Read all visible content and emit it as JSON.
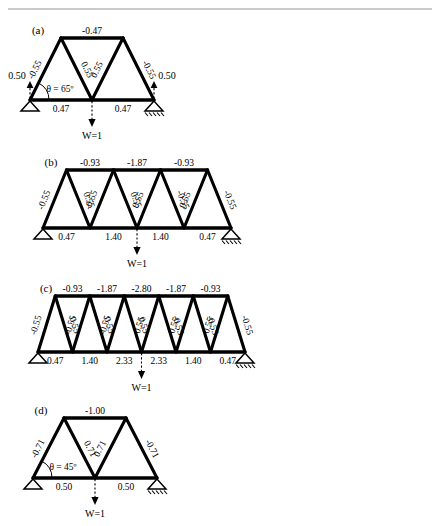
{
  "figure": {
    "background": "#ffffff",
    "ink_color": "#000000",
    "top_rule_color": "#b9b9b9",
    "load_text": "W=1",
    "panels": [
      {
        "id": "a",
        "label": "(a)",
        "angle_label": "θ = 65º",
        "bays": 2,
        "left_reaction": "0.50",
        "right_reaction": "0.50",
        "top_chord": [
          "-0.47"
        ],
        "bottom_chord": [
          "0.47",
          "0.47"
        ],
        "diagonals": [
          "-0.55",
          "0.55",
          "0.55",
          "-0.55"
        ],
        "load_text": "W=1"
      },
      {
        "id": "b",
        "label": "(b)",
        "angle_label": "",
        "bays": 4,
        "left_reaction": "",
        "right_reaction": "",
        "top_chord": [
          "-0.93",
          "-1.87",
          "-0.93"
        ],
        "bottom_chord": [
          "0.47",
          "1.40",
          "1.40",
          "0.47"
        ],
        "diagonals": [
          "-0.55",
          "0.55",
          "-0.55",
          "0.55",
          "0.55",
          "-0.55",
          "0.55",
          "-0.55"
        ],
        "load_text": "W=1"
      },
      {
        "id": "c",
        "label": "(c)",
        "angle_label": "",
        "bays": 6,
        "left_reaction": "",
        "right_reaction": "",
        "top_chord": [
          "-0.93",
          "-1.87",
          "-2.80",
          "-1.87",
          "-0.93"
        ],
        "bottom_chord": [
          "0.47",
          "1.40",
          "2.33",
          "2.33",
          "1.40",
          "0.47"
        ],
        "diagonals": [
          "-0.55",
          "0.55",
          "-0.55",
          "0.55",
          "-0.55",
          "0.55",
          "0.55",
          "-0.55",
          "0.55",
          "-0.55",
          "0.55",
          "-0.55"
        ],
        "load_text": "W=1"
      },
      {
        "id": "d",
        "label": "(d)",
        "angle_label": "θ = 45º",
        "bays": 2,
        "left_reaction": "",
        "right_reaction": "",
        "top_chord": [
          "-1.00"
        ],
        "bottom_chord": [
          "0.50",
          "0.50"
        ],
        "diagonals": [
          "-0.71",
          "0.71",
          "0.71",
          "-0.71"
        ],
        "load_text": "W=1"
      }
    ]
  },
  "chart_data": {
    "type": "diagram",
    "subtitle": "Four truss configurations with increasing number of bays",
    "panels": [
      {
        "panel": "a",
        "panel_label": "(a)",
        "n_bays": 2,
        "span_nodes_bottom": 3,
        "span_nodes_top": 2,
        "inclination_deg": 65,
        "angle_annotation": "θ = 65º",
        "unit_load": "W=1",
        "load_position": "mid-span bottom node",
        "reactions": {
          "left": 0.5,
          "right": 0.5
        },
        "supports": {
          "left": "pin",
          "right": "roller"
        },
        "top_chord_forces": [
          -0.47
        ],
        "bottom_chord_forces": [
          0.47,
          0.47
        ],
        "diagonal_forces": [
          -0.55,
          0.55,
          0.55,
          -0.55
        ],
        "sign_convention": "negative = compression, positive = tension"
      },
      {
        "panel": "b",
        "panel_label": "(b)",
        "n_bays": 4,
        "span_nodes_bottom": 5,
        "span_nodes_top": 4,
        "inclination_deg": 65,
        "angle_annotation": "",
        "unit_load": "W=1",
        "load_position": "mid-span bottom node",
        "reactions": {
          "left": 0.5,
          "right": 0.5
        },
        "supports": {
          "left": "pin",
          "right": "roller"
        },
        "top_chord_forces": [
          -0.93,
          -1.87,
          -0.93
        ],
        "bottom_chord_forces": [
          0.47,
          1.4,
          1.4,
          0.47
        ],
        "diagonal_forces": [
          -0.55,
          0.55,
          -0.55,
          0.55,
          0.55,
          -0.55,
          0.55,
          -0.55
        ],
        "sign_convention": "negative = compression, positive = tension"
      },
      {
        "panel": "c",
        "panel_label": "(c)",
        "n_bays": 6,
        "span_nodes_bottom": 7,
        "span_nodes_top": 6,
        "inclination_deg": 65,
        "angle_annotation": "",
        "unit_load": "W=1",
        "load_position": "mid-span bottom node",
        "reactions": {
          "left": 0.5,
          "right": 0.5
        },
        "supports": {
          "left": "pin",
          "right": "roller"
        },
        "top_chord_forces": [
          -0.93,
          -1.87,
          -2.8,
          -1.87,
          -0.93
        ],
        "bottom_chord_forces": [
          0.47,
          1.4,
          2.33,
          2.33,
          1.4,
          0.47
        ],
        "diagonal_forces": [
          -0.55,
          0.55,
          -0.55,
          0.55,
          -0.55,
          0.55,
          0.55,
          -0.55,
          0.55,
          -0.55,
          0.55,
          -0.55
        ],
        "sign_convention": "negative = compression, positive = tension"
      },
      {
        "panel": "d",
        "panel_label": "(d)",
        "n_bays": 2,
        "span_nodes_bottom": 3,
        "span_nodes_top": 2,
        "inclination_deg": 45,
        "angle_annotation": "θ = 45º",
        "unit_load": "W=1",
        "load_position": "mid-span bottom node",
        "reactions": {
          "left": 0.5,
          "right": 0.5
        },
        "supports": {
          "left": "pin",
          "right": "roller"
        },
        "top_chord_forces": [
          -1.0
        ],
        "bottom_chord_forces": [
          0.5,
          0.5
        ],
        "diagonal_forces": [
          -0.71,
          0.71,
          0.71,
          -0.71
        ],
        "sign_convention": "negative = compression, positive = tension"
      }
    ]
  }
}
